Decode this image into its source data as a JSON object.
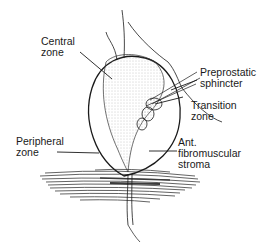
{
  "diagram": {
    "labels": {
      "central_zone": [
        "Central",
        "zone"
      ],
      "preprostatic_sphincter": [
        "Preprostatic",
        "sphincter"
      ],
      "transition_zone": [
        "Transition",
        "zone"
      ],
      "peripheral_zone": [
        "Peripheral",
        "zone"
      ],
      "ant_fibromuscular_stroma": [
        "Ant.",
        "fibromuscular",
        "stroma"
      ]
    },
    "colors": {
      "ink": "#1a1a1a",
      "shading": "#9a9a9a",
      "background": "#ffffff"
    }
  }
}
